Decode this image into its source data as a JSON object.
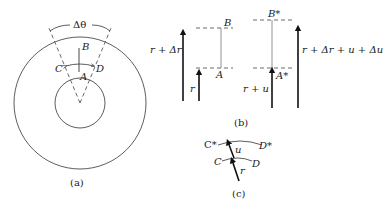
{
  "figure": {
    "panels": [
      {
        "id": "a",
        "caption": "(a)",
        "labels": {
          "delta_theta": "Δθ",
          "A": "A",
          "B": "B",
          "C": "C",
          "D": "D"
        }
      },
      {
        "id": "b",
        "caption": "(b)",
        "labels": {
          "r_plus_dr": "r + Δr",
          "r": "r",
          "A": "A",
          "B": "B",
          "B_star": "B*",
          "A_star": "A*",
          "r_plus_u": "r + u",
          "r_total": "r + Δr + u + Δu"
        }
      },
      {
        "id": "c",
        "caption": "(c)",
        "labels": {
          "C_star": "C*",
          "D_star": "D*",
          "u": "u",
          "C": "C",
          "D": "D",
          "r": "r"
        }
      }
    ]
  },
  "colors": {
    "stroke": "#333333",
    "thin": "#777777",
    "background": "#ffffff"
  }
}
